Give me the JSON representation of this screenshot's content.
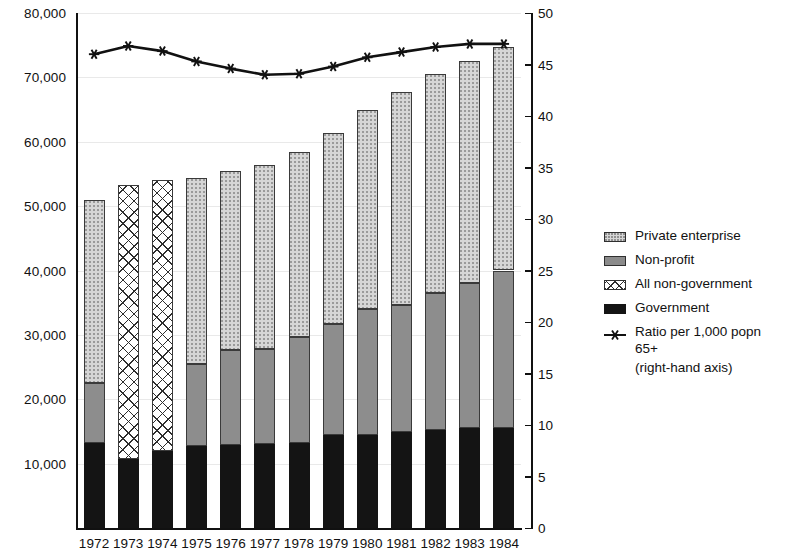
{
  "chart_data": {
    "type": "bar",
    "title": "",
    "subtitle": "",
    "xlabel": "",
    "ylabel": "",
    "y2label": "",
    "grid": true,
    "legend_position": "right",
    "categories": [
      "1972",
      "1973",
      "1974",
      "1975",
      "1976",
      "1977",
      "1978",
      "1979",
      "1980",
      "1981",
      "1982",
      "1983",
      "1984"
    ],
    "ylim": [
      0,
      80000
    ],
    "yticks": [
      0,
      10000,
      20000,
      30000,
      40000,
      50000,
      60000,
      70000,
      80000
    ],
    "ytick_labels": [
      "0",
      "10,000",
      "20,000",
      "30,000",
      "40,000",
      "50,000",
      "60,000",
      "70,000",
      "80,000"
    ],
    "y2lim": [
      0,
      50
    ],
    "y2ticks": [
      0,
      5,
      10,
      15,
      20,
      25,
      30,
      35,
      40,
      45,
      50
    ],
    "y2tick_labels": [
      "0",
      "5",
      "10",
      "15",
      "20",
      "25",
      "30",
      "35",
      "40",
      "45",
      "50"
    ],
    "stacked": true,
    "series": [
      {
        "name": "Government",
        "key": "government",
        "pattern": "solid-black",
        "color": "#141414",
        "values": [
          13200,
          10700,
          11900,
          12800,
          12900,
          13000,
          13200,
          14400,
          14400,
          14900,
          15300,
          15500,
          15600
        ]
      },
      {
        "name": "Non-profit",
        "key": "non_profit",
        "pattern": "gray-stipple",
        "color": "#8d8d8d",
        "values": [
          9300,
          null,
          null,
          12600,
          14700,
          14800,
          16400,
          17300,
          19600,
          19800,
          21200,
          22500,
          24400
        ]
      },
      {
        "name": "All non-government",
        "key": "all_non_government",
        "pattern": "crosshatch",
        "color": "#ffffff",
        "values": [
          null,
          42600,
          42200,
          null,
          null,
          null,
          null,
          null,
          null,
          null,
          null,
          null,
          null
        ]
      },
      {
        "name": "Private enterprise",
        "key": "private_enterprise",
        "pattern": "light-stipple",
        "color": "#d6d6d6",
        "values": [
          28500,
          null,
          null,
          29000,
          27800,
          28600,
          28800,
          29600,
          31000,
          33100,
          34100,
          34500,
          34700
        ]
      }
    ],
    "totals": [
      51000,
      53300,
      54100,
      54400,
      55400,
      56400,
      58400,
      61300,
      65000,
      67800,
      70600,
      72500,
      74700
    ],
    "line_series": {
      "name": "Ratio per 1,000 popn 65+",
      "axis": "right",
      "marker": "star",
      "color": "#111111",
      "values": [
        46.0,
        46.8,
        46.3,
        45.3,
        44.6,
        44.0,
        44.1,
        44.8,
        45.7,
        46.2,
        46.7,
        47.0,
        47.0
      ]
    }
  },
  "legend": {
    "items": [
      {
        "label": "Private enterprise",
        "swatch": "light-stipple"
      },
      {
        "label": "Non-profit",
        "swatch": "gray-stipple"
      },
      {
        "label": "All non-government",
        "swatch": "crosshatch"
      },
      {
        "label": "Government",
        "swatch": "solid-black"
      },
      {
        "label": "Ratio per 1,000 popn 65+",
        "swatch": "star-line"
      }
    ],
    "sub_label": "(right-hand axis)"
  }
}
